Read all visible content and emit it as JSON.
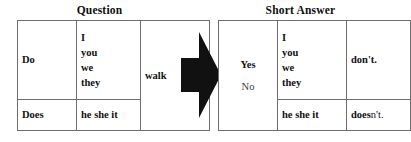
{
  "panels": {
    "question": {
      "title": "Question",
      "columns": [
        "auxiliary",
        "subject",
        "verb"
      ],
      "rows": [
        {
          "auxiliary": "Do",
          "subjects": [
            "I",
            "you",
            "we",
            "they"
          ],
          "verb": "walk"
        },
        {
          "auxiliary": "Does",
          "subjects": [
            "he she it"
          ],
          "verb": ""
        }
      ]
    },
    "short_answer": {
      "title": "Short Answer",
      "columns": [
        "response",
        "subject",
        "negative"
      ],
      "responses": [
        "Yes",
        "No"
      ],
      "rows": [
        {
          "subjects": [
            "I",
            "you",
            "we",
            "they"
          ],
          "negative": "don't.",
          "negative_bold_part": "don't."
        },
        {
          "subjects": [
            "he she it"
          ],
          "negative": "doesn't.",
          "negative_bold_part": "does",
          "negative_light_part": "n't."
        }
      ]
    }
  },
  "arrow": {
    "label": "flow-arrow-right",
    "direction": "right",
    "color": "#111111"
  },
  "colors": {
    "background": "#ffffff",
    "text": "#111111",
    "border": "#6e6e6e",
    "arrow": "#111111"
  }
}
